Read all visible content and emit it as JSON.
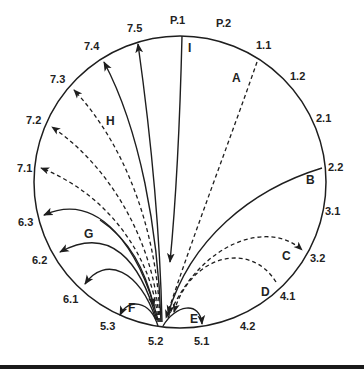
{
  "diagram": {
    "title": "",
    "circle": {
      "cx": 180,
      "cy": 182,
      "r": 146
    },
    "hub": {
      "label": "5.2",
      "x": 160,
      "y": 327
    },
    "perimeter_labels": [
      {
        "id": "P.1",
        "x": 170,
        "y": 24
      },
      {
        "id": "P.2",
        "x": 216,
        "y": 27
      },
      {
        "id": "1.1",
        "x": 256,
        "y": 49
      },
      {
        "id": "1.2",
        "x": 290,
        "y": 80
      },
      {
        "id": "2.1",
        "x": 316,
        "y": 122
      },
      {
        "id": "2.2",
        "x": 328,
        "y": 171
      },
      {
        "id": "3.1",
        "x": 325,
        "y": 215
      },
      {
        "id": "3.2",
        "x": 310,
        "y": 262
      },
      {
        "id": "4.1",
        "x": 280,
        "y": 300
      },
      {
        "id": "4.2",
        "x": 240,
        "y": 330
      },
      {
        "id": "5.1",
        "x": 194,
        "y": 345
      },
      {
        "id": "5.2",
        "x": 148,
        "y": 345
      },
      {
        "id": "5.3",
        "x": 100,
        "y": 330
      },
      {
        "id": "6.1",
        "x": 63,
        "y": 303
      },
      {
        "id": "6.2",
        "x": 32,
        "y": 264
      },
      {
        "id": "6.3",
        "x": 18,
        "y": 226
      },
      {
        "id": "7.1",
        "x": 17,
        "y": 172
      },
      {
        "id": "7.2",
        "x": 26,
        "y": 124
      },
      {
        "id": "7.3",
        "x": 50,
        "y": 83
      },
      {
        "id": "7.4",
        "x": 84,
        "y": 50
      },
      {
        "id": "7.5",
        "x": 127,
        "y": 32
      }
    ],
    "edge_labels": [
      {
        "id": "A",
        "x": 232,
        "y": 82
      },
      {
        "id": "B",
        "x": 306,
        "y": 184
      },
      {
        "id": "C",
        "x": 282,
        "y": 260
      },
      {
        "id": "D",
        "x": 261,
        "y": 296
      },
      {
        "id": "E",
        "x": 190,
        "y": 323
      },
      {
        "id": "F",
        "x": 128,
        "y": 312
      },
      {
        "id": "G",
        "x": 84,
        "y": 238
      },
      {
        "id": "H",
        "x": 106,
        "y": 125
      },
      {
        "id": "I",
        "x": 188,
        "y": 52
      }
    ],
    "edges": [
      {
        "label": "I",
        "from": "P.1",
        "to": "5.2",
        "style": "solid"
      },
      {
        "label": "",
        "from": "5.2",
        "to": "7.5",
        "style": "solid"
      },
      {
        "label": "",
        "from": "5.2",
        "to": "7.4",
        "style": "solid"
      },
      {
        "label": "H",
        "from": "5.2",
        "to": "7.3",
        "style": "dashed"
      },
      {
        "label": "",
        "from": "5.2",
        "to": "7.2",
        "style": "dashed"
      },
      {
        "label": "",
        "from": "5.2",
        "to": "7.1",
        "style": "dashed"
      },
      {
        "label": "A",
        "from": "1.1",
        "to": "5.2",
        "style": "dashed"
      },
      {
        "label": "B",
        "from": "2.2",
        "to": "5.2",
        "style": "solid"
      },
      {
        "label": "C",
        "from": "5.2",
        "to": "3.2",
        "style": "dashed"
      },
      {
        "label": "D",
        "from": "4.1",
        "to": "5.2",
        "style": "dashed"
      },
      {
        "label": "E",
        "from": "5.2",
        "to": "5.1",
        "style": "solid"
      },
      {
        "label": "F",
        "from": "5.2",
        "to": "5.3",
        "style": "solid"
      },
      {
        "label": "G",
        "from": "5.2",
        "to": "6.3",
        "style": "solid"
      },
      {
        "label": "",
        "from": "5.2",
        "to": "6.2",
        "style": "solid"
      },
      {
        "label": "",
        "from": "5.2",
        "to": "6.1",
        "style": "solid"
      },
      {
        "label": "",
        "from": "6.x",
        "to": "5.2",
        "style": "solid"
      }
    ]
  }
}
